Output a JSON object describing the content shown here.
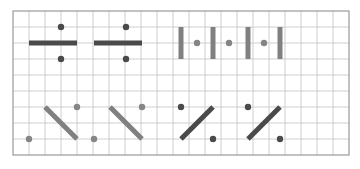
{
  "figure": {
    "kind": "grid-pattern-puzzle",
    "canvas": {
      "width": 360,
      "height": 169,
      "background": "#ffffff"
    },
    "grid": {
      "x": 13,
      "y": 11,
      "cell": 16,
      "cols": 21,
      "rows": 9,
      "line_color": "#c9c9c9",
      "line_width": 0.9,
      "border_color": "#9a9a9a",
      "border_width": 1.2,
      "show_grid": true
    },
    "colors": {
      "dark_stroke": "#4a4a4a",
      "mid_stroke": "#808080",
      "dark_dot": "#4a4a4a",
      "mid_dot": "#858585"
    },
    "strokes": {
      "bar_thickness": 5,
      "diagonal_thickness": 5,
      "dot_radius": 3.2
    },
    "shapes": [
      {
        "id": "h-bar-1",
        "type": "segment",
        "orientation": "horizontal",
        "color": "dark_stroke",
        "x1": 29,
        "y1": 43,
        "x2": 77,
        "y2": 43
      },
      {
        "id": "h-bar-1-dot-top",
        "type": "dot",
        "color": "dark_dot",
        "cx": 61,
        "cy": 27
      },
      {
        "id": "h-bar-1-dot-bottom",
        "type": "dot",
        "color": "dark_dot",
        "cx": 61,
        "cy": 59
      },
      {
        "id": "h-bar-2",
        "type": "segment",
        "orientation": "horizontal",
        "color": "dark_stroke",
        "x1": 94,
        "y1": 43,
        "x2": 142,
        "y2": 43
      },
      {
        "id": "h-bar-2-dot-top",
        "type": "dot",
        "color": "dark_dot",
        "cx": 126,
        "cy": 27
      },
      {
        "id": "h-bar-2-dot-bottom",
        "type": "dot",
        "color": "dark_dot",
        "cx": 126,
        "cy": 59
      },
      {
        "id": "v-bar-1",
        "type": "segment",
        "orientation": "vertical",
        "color": "mid_stroke",
        "x1": 181,
        "y1": 27,
        "x2": 181,
        "y2": 59
      },
      {
        "id": "v-dot-1",
        "type": "dot",
        "color": "mid_dot",
        "cx": 197,
        "cy": 43
      },
      {
        "id": "v-bar-2",
        "type": "segment",
        "orientation": "vertical",
        "color": "mid_stroke",
        "x1": 213,
        "y1": 27,
        "x2": 213,
        "y2": 59
      },
      {
        "id": "v-dot-2",
        "type": "dot",
        "color": "mid_dot",
        "cx": 229,
        "cy": 43
      },
      {
        "id": "v-bar-3",
        "type": "segment",
        "orientation": "vertical",
        "color": "mid_stroke",
        "x1": 248,
        "y1": 27,
        "x2": 248,
        "y2": 59
      },
      {
        "id": "v-dot-3",
        "type": "dot",
        "color": "mid_dot",
        "cx": 264,
        "cy": 43
      },
      {
        "id": "v-bar-4",
        "type": "segment",
        "orientation": "vertical",
        "color": "mid_stroke",
        "x1": 280,
        "y1": 27,
        "x2": 280,
        "y2": 59
      },
      {
        "id": "diag-back-1",
        "type": "segment",
        "orientation": "diagonal-back",
        "color": "mid_stroke",
        "x1": 45,
        "y1": 107,
        "x2": 77,
        "y2": 139
      },
      {
        "id": "diag-back-1-dot-ur",
        "type": "dot",
        "color": "mid_dot",
        "cx": 77,
        "cy": 107
      },
      {
        "id": "diag-back-1-dot-ll",
        "type": "dot",
        "color": "mid_dot",
        "cx": 29,
        "cy": 139
      },
      {
        "id": "diag-back-2",
        "type": "segment",
        "orientation": "diagonal-back",
        "color": "mid_stroke",
        "x1": 110,
        "y1": 107,
        "x2": 142,
        "y2": 139
      },
      {
        "id": "diag-back-2-dot-ur",
        "type": "dot",
        "color": "mid_dot",
        "cx": 142,
        "cy": 107
      },
      {
        "id": "diag-back-2-dot-ll",
        "type": "dot",
        "color": "mid_dot",
        "cx": 94,
        "cy": 139
      },
      {
        "id": "diag-fwd-1",
        "type": "segment",
        "orientation": "diagonal-forward",
        "color": "dark_stroke",
        "x1": 181,
        "y1": 139,
        "x2": 213,
        "y2": 107
      },
      {
        "id": "diag-fwd-1-dot-ul",
        "type": "dot",
        "color": "dark_dot",
        "cx": 181,
        "cy": 107
      },
      {
        "id": "diag-fwd-1-dot-lr",
        "type": "dot",
        "color": "dark_dot",
        "cx": 213,
        "cy": 139
      },
      {
        "id": "diag-fwd-2",
        "type": "segment",
        "orientation": "diagonal-forward",
        "color": "dark_stroke",
        "x1": 248,
        "y1": 139,
        "x2": 280,
        "y2": 107
      },
      {
        "id": "diag-fwd-2-dot-ul",
        "type": "dot",
        "color": "dark_dot",
        "cx": 248,
        "cy": 107
      },
      {
        "id": "diag-fwd-2-dot-lr",
        "type": "dot",
        "color": "dark_dot",
        "cx": 280,
        "cy": 139
      }
    ]
  }
}
